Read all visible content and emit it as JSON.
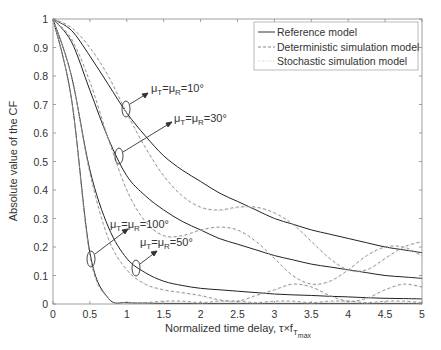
{
  "chart_data": {
    "type": "line",
    "title": "",
    "xlabel": "Normalized time delay, τ×f",
    "xlabel_sub": "T",
    "xlabel_subsub": "max",
    "ylabel": "Absolute value of the CF",
    "xlim": [
      0,
      5
    ],
    "ylim": [
      0,
      1
    ],
    "xticks": [
      "0",
      "0.5",
      "1",
      "1.5",
      "2",
      "2.5",
      "3",
      "3.5",
      "4",
      "4.5",
      "5"
    ],
    "yticks": [
      "0",
      "0.1",
      "0.2",
      "0.3",
      "0.4",
      "0.5",
      "0.6",
      "0.7",
      "0.8",
      "0.9",
      "1"
    ],
    "grid": false,
    "legend": {
      "position": "top-right",
      "entries": [
        {
          "label": "Reference model",
          "style": "solid"
        },
        {
          "label": "Deterministic simulation model",
          "style": "dashed"
        },
        {
          "label": "Stochastic simulation model",
          "style": "dotted"
        }
      ]
    },
    "annotations": [
      {
        "text": "μT=μR=10°",
        "at_x": 1.0,
        "at_y": 0.68
      },
      {
        "text": "μT=μR=30°",
        "at_x": 0.9,
        "at_y": 0.52
      },
      {
        "text": "μT=μR=100°",
        "at_x": 0.5,
        "at_y": 0.16
      },
      {
        "text": "μT=μR=50°",
        "at_x": 1.1,
        "at_y": 0.12
      }
    ],
    "x": [
      0,
      0.25,
      0.5,
      0.75,
      1,
      1.25,
      1.5,
      1.75,
      2,
      2.25,
      2.5,
      2.75,
      3,
      3.25,
      3.5,
      3.75,
      4,
      4.25,
      4.5,
      4.75,
      5
    ],
    "series": [
      {
        "name": "Reference model, μ=10°",
        "style": "solid",
        "values": [
          1,
          0.96,
          0.87,
          0.77,
          0.67,
          0.59,
          0.52,
          0.47,
          0.43,
          0.39,
          0.36,
          0.33,
          0.3,
          0.28,
          0.26,
          0.245,
          0.23,
          0.215,
          0.2,
          0.19,
          0.18
        ]
      },
      {
        "name": "Reference model, μ=30°",
        "style": "solid",
        "values": [
          1,
          0.92,
          0.75,
          0.58,
          0.45,
          0.38,
          0.33,
          0.29,
          0.26,
          0.23,
          0.21,
          0.19,
          0.17,
          0.155,
          0.14,
          0.13,
          0.12,
          0.11,
          0.1,
          0.095,
          0.09
        ]
      },
      {
        "name": "Reference model, μ=50°",
        "style": "solid",
        "values": [
          1,
          0.8,
          0.47,
          0.27,
          0.16,
          0.11,
          0.08,
          0.065,
          0.055,
          0.05,
          0.045,
          0.04,
          0.035,
          0.032,
          0.03,
          0.027,
          0.025,
          0.022,
          0.02,
          0.019,
          0.018
        ]
      },
      {
        "name": "Reference model, μ=100°",
        "style": "solid",
        "values": [
          1,
          0.72,
          0.18,
          0.02,
          0.005,
          0.003,
          0.002,
          0.002,
          0.002,
          0.002,
          0.002,
          0.002,
          0.002,
          0.002,
          0.002,
          0.002,
          0.002,
          0.002,
          0.002,
          0.002,
          0.002
        ]
      },
      {
        "name": "Deterministic simulation model, μ=10°",
        "style": "dashed",
        "values": [
          1,
          0.97,
          0.9,
          0.8,
          0.67,
          0.55,
          0.45,
          0.38,
          0.34,
          0.33,
          0.34,
          0.34,
          0.32,
          0.28,
          0.22,
          0.16,
          0.12,
          0.12,
          0.16,
          0.2,
          0.22
        ]
      },
      {
        "name": "Deterministic simulation model, μ=30°",
        "style": "dashed",
        "values": [
          1,
          0.93,
          0.78,
          0.58,
          0.4,
          0.29,
          0.24,
          0.24,
          0.26,
          0.27,
          0.26,
          0.22,
          0.16,
          0.1,
          0.07,
          0.08,
          0.12,
          0.17,
          0.2,
          0.2,
          0.17
        ]
      },
      {
        "name": "Deterministic simulation model, μ=50°",
        "style": "dashed",
        "values": [
          1,
          0.8,
          0.46,
          0.23,
          0.12,
          0.07,
          0.05,
          0.04,
          0.03,
          0.015,
          0.01,
          0.03,
          0.05,
          0.07,
          0.06,
          0.03,
          0.01,
          0.02,
          0.05,
          0.07,
          0.06
        ]
      },
      {
        "name": "Deterministic simulation model, μ=100°",
        "style": "dashed",
        "values": [
          1,
          0.72,
          0.17,
          0.02,
          0.005,
          0.005,
          0.01,
          0.01,
          0.005,
          0.01,
          0.01,
          0.005,
          0.01,
          0.01,
          0.005,
          0.01,
          0.01,
          0.005,
          0.01,
          0.01,
          0.005
        ]
      }
    ]
  }
}
